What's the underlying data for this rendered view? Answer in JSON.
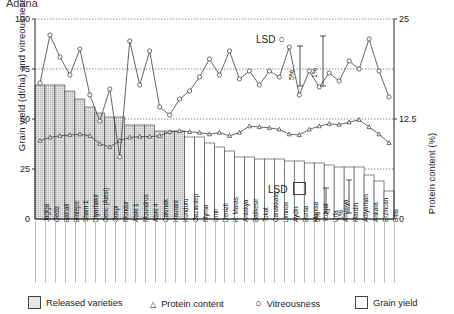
{
  "title": "Adana",
  "axes": {
    "left_label": "Grain yield (dt/ha) and vitreousness (%)",
    "right_label": "Protein content (%)",
    "left_ticks": [
      "25",
      "50",
      "75",
      "100"
    ],
    "right_ticks": [
      "12.5",
      "25"
    ],
    "left_range": [
      0,
      100
    ],
    "right_range": [
      0,
      25
    ]
  },
  "annotations": {
    "lsd_vitreousness": {
      "label": "LSD",
      "marker": "vitreousness-circle",
      "level_a": "5%",
      "level_b": "1%"
    },
    "lsd_grainyield": {
      "label": "LSD",
      "marker": "grain-yield-square",
      "level_a": "5%",
      "level_b": "1%"
    }
  },
  "legend": [
    {
      "name": "released-varieties",
      "label": "Released varieties",
      "glyph": "filled-square"
    },
    {
      "name": "protein-content",
      "label": "Protein content",
      "glyph": "triangle"
    },
    {
      "name": "vitreousness",
      "label": "Vitreousness",
      "glyph": "circle"
    },
    {
      "name": "grain-yield",
      "label": "Grain yield",
      "glyph": "open-square"
    }
  ],
  "chart_data": {
    "type": "bar",
    "title": "Adana",
    "xlabel": "",
    "ylabel": "Grain yield (dt/ha) and vitreousness (%)",
    "y2label": "Protein content (%)",
    "ylim": [
      0,
      100
    ],
    "y2lim": [
      0,
      25
    ],
    "grid": true,
    "legend_position": "bottom",
    "categories": [
      "Jagiga",
      "Gediz",
      "Balcali",
      "Bintepe",
      "Sham 1",
      "Diyarbakir",
      "Genc (Aiesi)",
      "Gokpi",
      "Mondur",
      "Atski 1",
      "Moundros",
      "Atski 4",
      "Cakmak",
      "Haurani",
      "Kunduru",
      "Gaziantep",
      "Myrna",
      "Izmir",
      "Denizli",
      "K. Maras",
      "Antakya",
      "Balikesir",
      "Tokat",
      "Canakkale",
      "Limnos",
      "Aydin",
      "Bursa",
      "Manisa",
      "Yozgat",
      "Urfa",
      "Amasya",
      "Mardin",
      "Adiyaman",
      "Ankara",
      "Erzincan",
      "Bitlis"
    ],
    "released": [
      true,
      true,
      true,
      true,
      true,
      true,
      true,
      true,
      true,
      true,
      true,
      true,
      true,
      true,
      true,
      false,
      false,
      false,
      false,
      false,
      false,
      false,
      false,
      false,
      false,
      false,
      false,
      false,
      false,
      false,
      false,
      false,
      false,
      false,
      false,
      false
    ],
    "series": [
      {
        "name": "Grain yield",
        "axis": "left",
        "unit": "dt/ha",
        "type": "bar",
        "values": [
          67,
          67,
          67,
          64,
          60,
          56,
          53,
          51,
          51,
          47,
          47,
          47,
          44,
          44,
          44,
          41,
          41,
          38,
          36,
          34,
          31,
          31,
          30,
          30,
          30,
          29,
          29,
          28,
          28,
          27,
          26,
          26,
          26,
          22,
          19,
          14
        ]
      },
      {
        "name": "Vitreousness",
        "axis": "left",
        "unit": "%",
        "type": "line",
        "marker": "circle",
        "values": [
          68,
          92,
          81,
          72,
          85,
          62,
          49,
          65,
          31,
          89,
          67,
          84,
          56,
          52,
          60,
          64,
          71,
          80,
          72,
          84,
          70,
          74,
          67,
          74,
          71,
          86,
          62,
          74,
          66,
          73,
          69,
          79,
          75,
          90,
          74,
          61
        ]
      },
      {
        "name": "Protein content",
        "axis": "right",
        "unit": "%",
        "type": "line",
        "marker": "triangle",
        "values": [
          9.8,
          10.2,
          10.4,
          10.5,
          10.6,
          10.4,
          9.4,
          9.0,
          9.8,
          10.2,
          10.3,
          10.3,
          10.4,
          10.9,
          11.0,
          10.9,
          10.8,
          10.6,
          10.8,
          10.4,
          10.8,
          11.6,
          11.5,
          11.4,
          11.2,
          10.6,
          10.5,
          11.2,
          11.6,
          11.9,
          11.8,
          12.1,
          12.4,
          11.5,
          10.6,
          9.5
        ]
      }
    ]
  }
}
